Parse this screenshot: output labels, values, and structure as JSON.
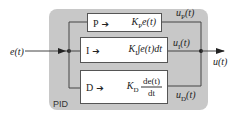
{
  "diagram": {
    "title": "PID",
    "input_signal": "e(t)",
    "output_signal": "u(t)",
    "blocks": [
      {
        "id": "P",
        "label": "P",
        "arrow": "➔",
        "expr_main": "K",
        "expr_sub": "P",
        "expr_rest": "e(t)",
        "output_main": "u",
        "output_sub": "P",
        "output_rest": "(t)"
      },
      {
        "id": "I",
        "label": "I",
        "arrow": "➔",
        "expr_main": "K",
        "expr_sub": "I",
        "expr_rest": "∫e(t)dt",
        "output_main": "u",
        "output_sub": "I",
        "output_rest": "(t)"
      },
      {
        "id": "D",
        "label": "D",
        "arrow": "➔",
        "expr_main": "K",
        "expr_sub": "D",
        "expr_num": "de(t)",
        "expr_den": "dt",
        "output_main": "u",
        "output_sub": "D",
        "output_rest": "(t)"
      }
    ],
    "colors": {
      "container": "#c8c8c8",
      "block_fill": "#ffffff",
      "line": "#444444"
    }
  }
}
